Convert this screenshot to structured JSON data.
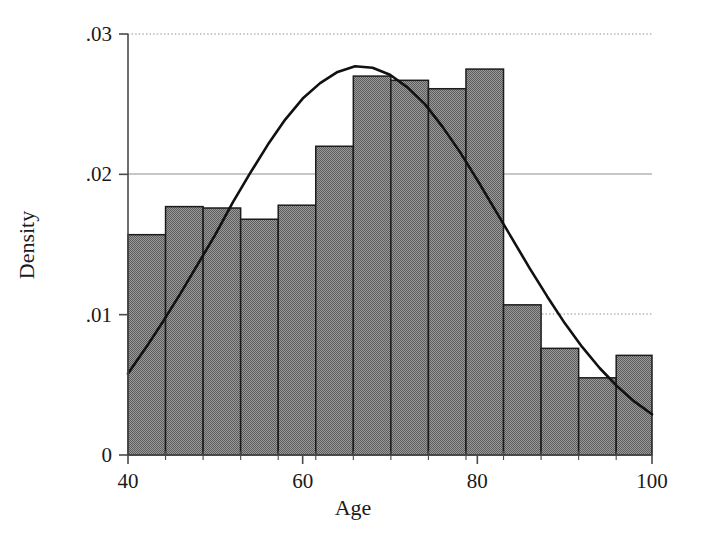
{
  "chart_data": {
    "type": "bar",
    "title": "",
    "subtitle": "",
    "xlabel": "Age",
    "ylabel": "Density",
    "xlim": [
      40,
      100
    ],
    "ylim": [
      0,
      0.03
    ],
    "xticks": [
      40,
      60,
      80,
      100
    ],
    "xtick_labels": [
      "40",
      "60",
      "80",
      "100"
    ],
    "yticks": [
      0,
      0.01,
      0.02,
      0.03
    ],
    "ytick_labels": [
      "0",
      ".01",
      ".02",
      ".03"
    ],
    "grid": "horizontal-dotted-at-y-ticks",
    "legend": "none",
    "bin_width": 4.3,
    "bin_edges": [
      40.0,
      44.3,
      48.6,
      52.9,
      57.2,
      61.5,
      65.8,
      70.1,
      74.4,
      78.7,
      83.0,
      87.3,
      91.6,
      95.9,
      100.2
    ],
    "bin_centers": [
      42.15,
      46.45,
      50.75,
      55.05,
      59.35,
      63.65,
      67.95,
      72.25,
      76.55,
      80.85,
      85.15,
      89.45,
      93.75,
      98.05
    ],
    "categories": [
      "40-44.3",
      "44.3-48.6",
      "48.6-52.9",
      "52.9-57.2",
      "57.2-61.5",
      "61.5-65.8",
      "65.8-70.1",
      "70.1-74.4",
      "74.4-78.7",
      "78.7-83.0",
      "83.0-87.3",
      "87.3-91.6",
      "91.6-95.9",
      "95.9-100.2"
    ],
    "values": [
      0.0157,
      0.0177,
      0.0176,
      0.0168,
      0.0178,
      0.022,
      0.027,
      0.0267,
      0.0261,
      0.0275,
      0.0107,
      0.0076,
      0.0055,
      0.0071
    ],
    "bar_fill": "#7e7e7e",
    "bar_edge": "#1c1c1c",
    "overlay": {
      "name": "normal-density-curve",
      "type": "line",
      "color": "#111111",
      "mean": 66.5,
      "sd": 15.6,
      "peak_value": 0.0277,
      "x": [
        40,
        42,
        44,
        46,
        48,
        50,
        52,
        54,
        56,
        58,
        60,
        62,
        64,
        66,
        68,
        70,
        72,
        74,
        76,
        78,
        80,
        82,
        84,
        86,
        88,
        90,
        92,
        94,
        96,
        98,
        100
      ],
      "y": [
        0.0058,
        0.0076,
        0.0095,
        0.0115,
        0.0136,
        0.0157,
        0.018,
        0.0201,
        0.0221,
        0.0239,
        0.0254,
        0.0265,
        0.0273,
        0.0277,
        0.0276,
        0.0271,
        0.0262,
        0.025,
        0.0234,
        0.0216,
        0.0196,
        0.0175,
        0.0154,
        0.0133,
        0.0113,
        0.0094,
        0.0077,
        0.0062,
        0.0049,
        0.0038,
        0.0029
      ]
    }
  },
  "axis": {
    "x_title": "Age",
    "y_title": "Density",
    "x_tick_labels": [
      "40",
      "60",
      "80",
      "100"
    ],
    "y_tick_labels": [
      "0",
      ".01",
      ".02",
      ".03"
    ]
  }
}
